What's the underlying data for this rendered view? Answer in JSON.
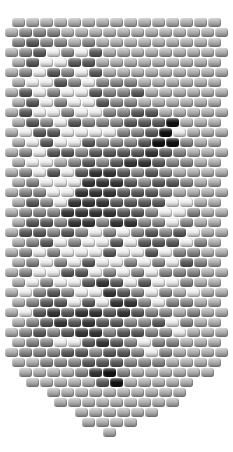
{
  "pattern": {
    "title": "bead pennant pattern with bird motif",
    "bead": {
      "width": 13,
      "height": 9,
      "pitch_x": 14,
      "pitch_y": 10,
      "top": 18
    },
    "palette": {
      "a": "#b5b5b5",
      "b": "#8e8e8e",
      "c": "#616161",
      "d": "#3c3c3c",
      "k": "#141414",
      "w": "#f4f4f4"
    },
    "rows": [
      {
        "x": 12,
        "beads": "aaaaaaaaaaaaaaa"
      },
      {
        "x": 5,
        "beads": "abbbaaaaaaaaaaaa"
      },
      {
        "x": 12,
        "beads": "bcbbabaaaaaaaaa"
      },
      {
        "x": 5,
        "beads": "abcwbwcaaaaaaaaa"
      },
      {
        "x": 12,
        "beads": "acwwccaaaaaaaaa"
      },
      {
        "x": 5,
        "beads": "abwcbwcaaaaaaaaa"
      },
      {
        "x": 12,
        "beads": "awwcbwbbbaaaaaa"
      },
      {
        "x": 5,
        "beads": "acwbwwcbbcaaaaaa"
      },
      {
        "x": 12,
        "beads": "acwbwwcbbaaaaaa"
      },
      {
        "x": 5,
        "beads": "acwwbwwbbccaaaaa"
      },
      {
        "x": 12,
        "beads": "acbwcbbbccckaaa"
      },
      {
        "x": 5,
        "beads": "awccwwwwbbckwaaa"
      },
      {
        "x": 12,
        "beads": "awcwwcbbbckkbaa"
      },
      {
        "x": 5,
        "beads": "abwccbccccdcbaaa"
      },
      {
        "x": 12,
        "beads": "awwabcbcddcbbaa"
      },
      {
        "x": 5,
        "beads": "abwcwcddcbcbaaaa"
      },
      {
        "x": 12,
        "beads": "abwwwdddcbccbaa"
      },
      {
        "x": 5,
        "beads": "abbwwdddcccbaaaa"
      },
      {
        "x": 12,
        "beads": "acbwdddccccwwaa"
      },
      {
        "x": 5,
        "beads": "abbbddddccbwwbaa"
      },
      {
        "x": 12,
        "beads": "accbddbddbbwbaa"
      },
      {
        "x": 5,
        "beads": "accbcbwbwbcbcwaa"
      },
      {
        "x": 12,
        "beads": "abcwbwwcwcccwba"
      },
      {
        "x": 5,
        "beads": "abwbwwwcwwcwbbaa"
      },
      {
        "x": 12,
        "beads": "abwbwcwwbwbwcba"
      },
      {
        "x": 5,
        "beads": "abwwccwbwbwbbbaa"
      },
      {
        "x": 12,
        "beads": "awbwwcdcwcwwbaa"
      },
      {
        "x": 5,
        "beads": "awbcbwwdcbwbawaa"
      },
      {
        "x": 12,
        "beads": "abccwcwddbwbbaa"
      },
      {
        "x": 5,
        "beads": "awcdcddcdcbbabaa"
      },
      {
        "x": 12,
        "beads": "abcdcdccbbcwbaa"
      },
      {
        "x": 5,
        "beads": "abcbcddbccbbwaaa"
      },
      {
        "x": 12,
        "beads": "abbwwcdcbwbbaaa"
      },
      {
        "x": 5,
        "beads": "abbbccbccbwbaaaa"
      },
      {
        "x": 12,
        "beads": "aabbbcccbbbaaaa"
      },
      {
        "x": 19,
        "beads": "aaaabdkbaaaaaa"
      },
      {
        "x": 26,
        "beads": "aaaaackaaaaa"
      },
      {
        "x": 47,
        "beads": "aaaaaaaaaa"
      },
      {
        "x": 54,
        "beads": "aaaaaaaaa"
      },
      {
        "x": 75,
        "beads": "aaaaaa"
      },
      {
        "x": 82,
        "beads": "aaaa"
      },
      {
        "x": 103,
        "beads": "a"
      }
    ]
  }
}
